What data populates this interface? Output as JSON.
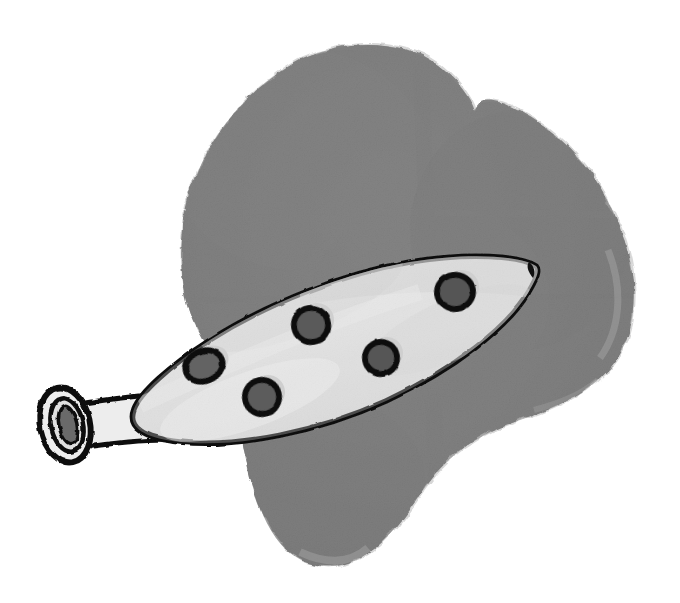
{
  "artwork": {
    "title": "Ocarina over grey wash blob",
    "medium": "ink line drawing with grey watercolour wash",
    "canvas": {
      "width": 680,
      "height": 603,
      "background": "#ffffff"
    },
    "alt_text": "A hand drawn ocarina with five finger holes and a tubular mouthpiece, drawn on top of a large irregular grey painted blob."
  },
  "palette": {
    "background": "#ffffff",
    "blob_grey": "#808080",
    "blob_grey_dark": "#757575",
    "blob_grey_light": "#8d8d8d",
    "blob_edge_pale": "#b8b8b8",
    "body_fill": "#e4e4e4",
    "body_fill_shadow": "#d3d3d3",
    "body_highlight": "#f2f2f2",
    "ink_black": "#111111",
    "hole_fill": "#585858",
    "hole_fill_light": "#6d6d6d",
    "mouthpiece_fill": "#ededed",
    "mouthpiece_bore": "#6a6a6a"
  },
  "elements": {
    "blob": {
      "label": "grey wash background blob",
      "fill": "#808080",
      "notch_x": 475,
      "notch_y": 110,
      "bounds": {
        "x": 180,
        "y": 38,
        "width": 460,
        "height": 530
      }
    },
    "ocarina": {
      "label": "ocarina",
      "body": {
        "label": "ocarina body",
        "fill": "#e4e4e4",
        "stroke": "#111111",
        "stroke_width": 5,
        "tip_x": 536,
        "tip_y": 266
      },
      "mouthpiece": {
        "label": "mouthpiece",
        "fill": "#ededed",
        "bore_fill": "#6a6a6a",
        "stroke": "#111111",
        "center_x": 65,
        "center_y": 425
      },
      "neck": {
        "label": "mouthpiece neck",
        "fill": "#ededed",
        "stroke": "#111111"
      },
      "finger_holes": [
        {
          "id": "hole-1",
          "label": "finger hole 1",
          "cx": 204,
          "cy": 366,
          "rx": 19,
          "ry": 15,
          "rotate": -22,
          "fill": "#636363"
        },
        {
          "id": "hole-2",
          "label": "finger hole 2",
          "cx": 262,
          "cy": 397,
          "rx": 17,
          "ry": 17,
          "rotate": -14,
          "fill": "#5c5c5c"
        },
        {
          "id": "hole-3",
          "label": "finger hole 3",
          "cx": 311,
          "cy": 325,
          "rx": 17,
          "ry": 17,
          "rotate": -10,
          "fill": "#5a5a5a"
        },
        {
          "id": "hole-4",
          "label": "finger hole 4",
          "cx": 381,
          "cy": 358,
          "rx": 16,
          "ry": 16,
          "rotate": -10,
          "fill": "#575757"
        },
        {
          "id": "hole-5",
          "label": "finger hole 5",
          "cx": 455,
          "cy": 292,
          "rx": 18,
          "ry": 17,
          "rotate": -8,
          "fill": "#555555"
        }
      ],
      "hole_count": 5
    }
  }
}
